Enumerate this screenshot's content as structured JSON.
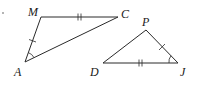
{
  "diagram": {
    "type": "congruent-triangles",
    "triangles": [
      {
        "name": "triangle-MAC",
        "vertices": {
          "M": {
            "label": "M",
            "x": 41,
            "y": 17
          },
          "A": {
            "label": "A",
            "x": 25,
            "y": 62
          },
          "C": {
            "label": "C",
            "x": 118,
            "y": 17
          }
        },
        "marks": {
          "MC": "double-tick",
          "AM": "single-tick",
          "angle_A": "single-arc"
        }
      },
      {
        "name": "triangle-PDJ",
        "vertices": {
          "P": {
            "label": "P",
            "x": 146,
            "y": 30
          },
          "D": {
            "label": "D",
            "x": 103,
            "y": 63
          },
          "J": {
            "label": "J",
            "x": 178,
            "y": 63
          }
        },
        "marks": {
          "DJ": "double-tick",
          "PJ": "single-tick",
          "angle_J": "single-arc"
        }
      }
    ],
    "labels": {
      "M": "M",
      "A": "A",
      "C": "C",
      "P": "P",
      "D": "D",
      "J": "J"
    },
    "stroke_color": "#2a2a2a"
  }
}
